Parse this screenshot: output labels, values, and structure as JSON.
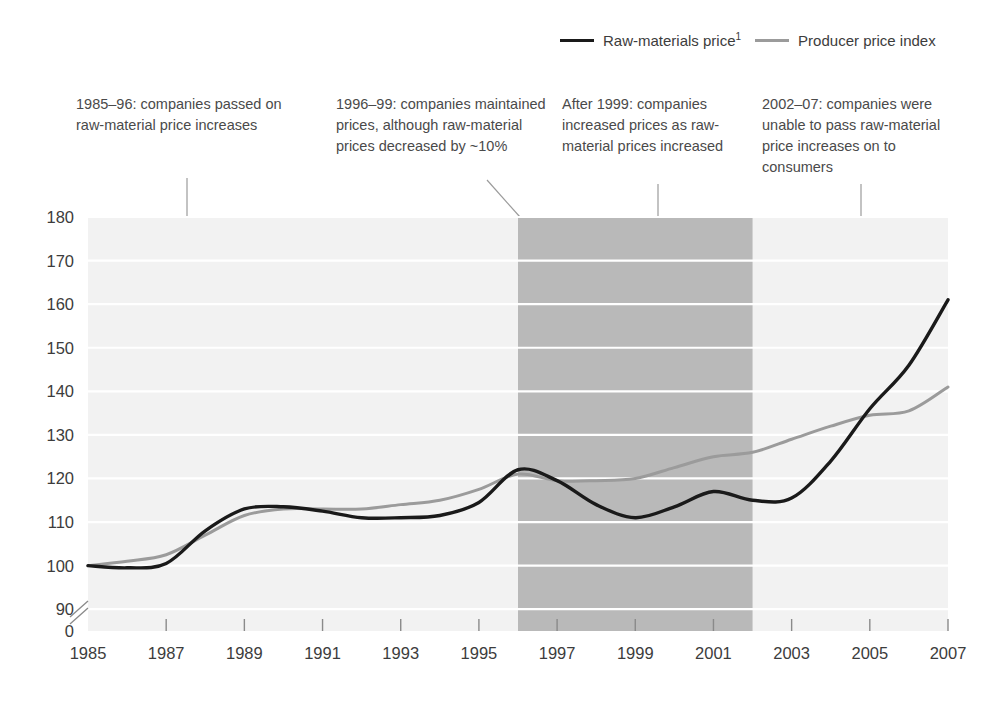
{
  "legend": {
    "entries": [
      {
        "label": "Raw-materials price",
        "footnote": "1",
        "color": "#1a1a1a",
        "key": "raw-materials-price"
      },
      {
        "label": "Producer price index",
        "footnote": "",
        "color": "#9b9b9b",
        "key": "producer-price-index"
      }
    ]
  },
  "annotations": [
    {
      "id": "a1",
      "text": "1985–96: companies passed on raw-material price increases"
    },
    {
      "id": "a2",
      "text": "1996–99: companies maintained prices, although raw-material prices decreased by ~10%"
    },
    {
      "id": "a3",
      "text": "After 1999: companies increased prices as raw-material prices increased"
    },
    {
      "id": "a4",
      "text": "2002–07: companies were unable to pass raw-material price increases on to consumers"
    }
  ],
  "chart_data": {
    "type": "line",
    "title": "",
    "xlabel": "",
    "ylabel": "",
    "xlim": [
      1985,
      2007
    ],
    "ylim": [
      85,
      180
    ],
    "grid": true,
    "legend_position": "top-right",
    "y_ticks": [
      90,
      100,
      110,
      120,
      130,
      140,
      150,
      160,
      170,
      180
    ],
    "y_axis_break": true,
    "y_axis_break_label": "0",
    "x_ticks": [
      1985,
      1987,
      1989,
      1991,
      1993,
      1995,
      1997,
      1999,
      2001,
      2003,
      2005,
      2007
    ],
    "x": [
      1985,
      1986,
      1987,
      1988,
      1989,
      1990,
      1991,
      1992,
      1993,
      1994,
      1995,
      1996,
      1997,
      1998,
      1999,
      2000,
      2001,
      2002,
      2003,
      2004,
      2005,
      2006,
      2007
    ],
    "series": [
      {
        "name": "Raw-materials price",
        "color": "#1a1a1a",
        "values": [
          100,
          99.5,
          100.5,
          108,
          113,
          113.5,
          112.5,
          111,
          111,
          111.5,
          114.5,
          122,
          119.5,
          114,
          111,
          113.5,
          117,
          115,
          115.5,
          124,
          136,
          146,
          161
        ]
      },
      {
        "name": "Producer price index",
        "color": "#9b9b9b",
        "values": [
          100,
          101,
          102.5,
          107,
          111.5,
          113,
          113,
          113,
          114,
          115,
          117.5,
          121,
          119.5,
          119.5,
          120,
          122.5,
          125,
          126,
          129,
          132,
          134.5,
          135.5,
          141
        ]
      }
    ],
    "highlight_band": {
      "start": 1996,
      "end": 2002,
      "color": "#b9b9b9"
    }
  }
}
